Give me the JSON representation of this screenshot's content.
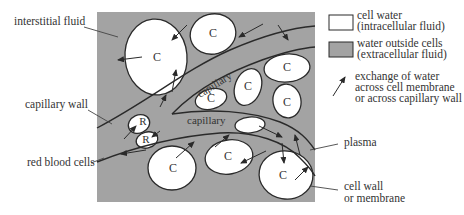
{
  "diagram": {
    "colors": {
      "extracellular": "#a3a3a3",
      "intracellular": "#ffffff",
      "stroke": "#2a2a2a",
      "text": "#333333"
    },
    "cell_label": "C",
    "rbc_label": "R",
    "capillary_label": "capillary",
    "labels": {
      "interstitial_fluid": "interstitial fluid",
      "capillary_wall": "capillary wall",
      "red_blood_cells": "red blood cells",
      "plasma": "plasma",
      "cell_wall_line1": "cell wall",
      "cell_wall_line2": "or membrane"
    }
  },
  "legend": {
    "items": [
      {
        "swatch": "white",
        "line1": "cell water",
        "line2": "(intracellular fluid)"
      },
      {
        "swatch": "gray",
        "line1": "water outside cells",
        "line2": "(extracellular fluid)"
      },
      {
        "swatch": "arrow",
        "line1": "exchange of water",
        "line2": "across cell membrane",
        "line3": "or across capillary wall"
      }
    ]
  }
}
